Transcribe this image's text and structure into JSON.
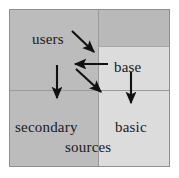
{
  "diagram": {
    "frame": {
      "border_color": "#8e8e8e",
      "background": "#ffffff"
    },
    "regions": [
      {
        "name": "users",
        "fill": "#bcbcbc",
        "position": "top-left"
      },
      {
        "name": "base",
        "fill": "#dcdcdc",
        "position": "top-right"
      },
      {
        "name": "secondary",
        "fill": "#bcbcbc",
        "position": "bottom-left"
      },
      {
        "name": "basic",
        "fill": "#dcdcdc",
        "position": "bottom-right"
      }
    ],
    "labels": {
      "users": "users",
      "base": "base",
      "secondary": "secondary",
      "sources": "sources",
      "basic": "basic"
    },
    "arrow_color": "#111111",
    "arrows": [
      {
        "name": "users-to-base",
        "from": "users",
        "to": "base",
        "direction": "down-right"
      },
      {
        "name": "base-to-users",
        "from": "base",
        "to": "users",
        "direction": "left"
      },
      {
        "name": "base-to-basic-diagonal",
        "from": "base",
        "to": "basic",
        "direction": "down-right"
      },
      {
        "name": "users-to-secondary",
        "from": "users",
        "to": "secondary",
        "direction": "down"
      },
      {
        "name": "base-to-basic",
        "from": "base",
        "to": "basic",
        "direction": "down"
      }
    ]
  }
}
